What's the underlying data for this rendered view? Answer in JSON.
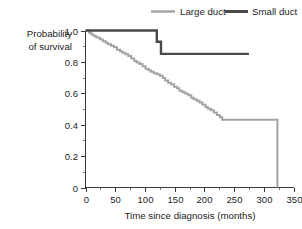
{
  "chart_data": {
    "type": "line",
    "subtype": "kaplan-meier-step",
    "title": "",
    "xlabel": "Time since diagnosis (months)",
    "ylabel": "Probability of survival",
    "ylabel_line1": "Probability",
    "ylabel_line2": "of survival",
    "xlim": [
      0,
      350
    ],
    "ylim": [
      0,
      1.0
    ],
    "grid": false,
    "legend_position": "top",
    "x_ticks": [
      0,
      50,
      100,
      150,
      200,
      250,
      300,
      350
    ],
    "x_tick_labels": [
      "0",
      "50",
      "100",
      "150",
      "200",
      "250",
      "300",
      "350"
    ],
    "x_minor_ticks": [
      25,
      75,
      125,
      175,
      225,
      275,
      325
    ],
    "y_ticks": [
      0,
      0.2,
      0.4,
      0.6,
      0.8,
      1.0
    ],
    "y_tick_labels": [
      "0",
      "0.2",
      "0.4",
      "0.6",
      "0.8",
      "1.0"
    ],
    "y_minor_ticks": [
      0.1,
      0.3,
      0.5,
      0.7,
      0.9
    ],
    "series": [
      {
        "name": "Large duct",
        "color": "#a3a3a3",
        "line_width": 2.0,
        "points": [
          [
            0,
            1.0
          ],
          [
            6,
            0.985
          ],
          [
            10,
            0.975
          ],
          [
            14,
            0.965
          ],
          [
            18,
            0.955
          ],
          [
            24,
            0.945
          ],
          [
            29,
            0.932
          ],
          [
            34,
            0.922
          ],
          [
            38,
            0.912
          ],
          [
            43,
            0.903
          ],
          [
            48,
            0.893
          ],
          [
            53,
            0.878
          ],
          [
            58,
            0.868
          ],
          [
            62,
            0.858
          ],
          [
            67,
            0.848
          ],
          [
            72,
            0.838
          ],
          [
            77,
            0.822
          ],
          [
            82,
            0.806
          ],
          [
            86,
            0.796
          ],
          [
            91,
            0.786
          ],
          [
            96,
            0.772
          ],
          [
            101,
            0.757
          ],
          [
            106,
            0.747
          ],
          [
            110,
            0.737
          ],
          [
            115,
            0.727
          ],
          [
            120,
            0.722
          ],
          [
            125,
            0.712
          ],
          [
            130,
            0.697
          ],
          [
            134,
            0.682
          ],
          [
            139,
            0.667
          ],
          [
            144,
            0.657
          ],
          [
            149,
            0.642
          ],
          [
            154,
            0.632
          ],
          [
            158,
            0.617
          ],
          [
            163,
            0.607
          ],
          [
            168,
            0.597
          ],
          [
            173,
            0.587
          ],
          [
            178,
            0.572
          ],
          [
            182,
            0.562
          ],
          [
            187,
            0.552
          ],
          [
            192,
            0.542
          ],
          [
            197,
            0.527
          ],
          [
            202,
            0.512
          ],
          [
            206,
            0.502
          ],
          [
            211,
            0.492
          ],
          [
            216,
            0.477
          ],
          [
            221,
            0.462
          ],
          [
            226,
            0.447
          ],
          [
            230,
            0.432
          ],
          [
            323,
            0.432
          ],
          [
            323,
            0.0
          ]
        ]
      },
      {
        "name": "Small duct",
        "color": "#4a4a4a",
        "line_width": 2.4,
        "points": [
          [
            0,
            1.0
          ],
          [
            120,
            1.0
          ],
          [
            120,
            0.928
          ],
          [
            127,
            0.928
          ],
          [
            127,
            0.851
          ],
          [
            275,
            0.851
          ]
        ]
      }
    ],
    "legend": [
      {
        "label": "Large duct",
        "color": "#a3a3a3",
        "line_width": 2.4
      },
      {
        "label": "Small duct",
        "color": "#4a4a4a",
        "line_width": 3.0
      }
    ]
  }
}
